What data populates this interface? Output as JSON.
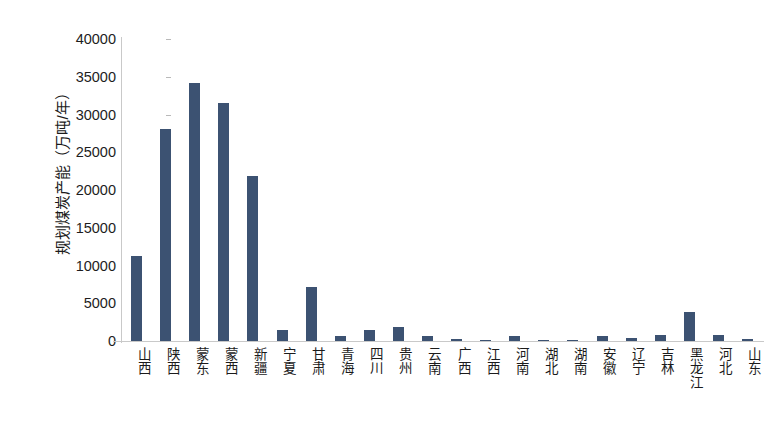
{
  "chart_data": {
    "type": "bar",
    "title": "",
    "subtitle": "",
    "xlabel": "",
    "ylabel": "规划煤炭产能（万吨/年）",
    "ylim": [
      0,
      40000
    ],
    "y_ticks": [
      0,
      5000,
      10000,
      15000,
      20000,
      25000,
      30000,
      35000,
      40000
    ],
    "y_tick_labels": [
      "0",
      "5000",
      "10000",
      "15000",
      "20000",
      "25000",
      "30000",
      "35000",
      "40000"
    ],
    "grid": false,
    "legend": false,
    "legend_position": "none",
    "bar_color": "#3c5272",
    "axis_color": "#c9c9c9",
    "text_color": "#1b1b1b",
    "categories": [
      "山西",
      "陕西",
      "蒙东",
      "蒙西",
      "新疆",
      "宁夏",
      "甘肃",
      "青海",
      "四川",
      "贵州",
      "云南",
      "广西",
      "江西",
      "河南",
      "湖北",
      "湖南",
      "安徽",
      "辽宁",
      "吉林",
      "黑龙江",
      "河北",
      "山东"
    ],
    "values": [
      11300,
      28100,
      34200,
      31500,
      21900,
      1400,
      7100,
      700,
      1400,
      1900,
      600,
      250,
      200,
      600,
      60,
      60,
      700,
      400,
      800,
      3800,
      800,
      250
    ]
  }
}
